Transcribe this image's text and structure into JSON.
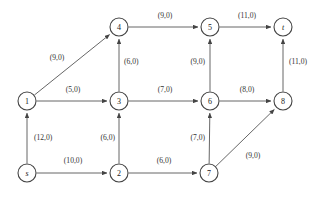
{
  "figure": {
    "type": "directed-network-flow-graph",
    "label_format": "(capacity,flow)",
    "background_color": "#ffffff",
    "edge_color": "#555555",
    "node_stroke_color": "#444444",
    "text_color": "#1a1a1a"
  },
  "nodes": [
    {
      "id": "s",
      "label": "s",
      "x": 27,
      "y": 173,
      "r": 9,
      "italic": true
    },
    {
      "id": "1",
      "label": "1",
      "x": 27,
      "y": 101,
      "r": 9,
      "italic": false
    },
    {
      "id": "2",
      "label": "2",
      "x": 119,
      "y": 173,
      "r": 9,
      "italic": false
    },
    {
      "id": "3",
      "label": "3",
      "x": 119,
      "y": 101,
      "r": 9,
      "italic": false
    },
    {
      "id": "4",
      "label": "4",
      "x": 119,
      "y": 27,
      "r": 9,
      "italic": false
    },
    {
      "id": "5",
      "label": "5",
      "x": 210,
      "y": 27,
      "r": 9,
      "italic": false
    },
    {
      "id": "6",
      "label": "6",
      "x": 210,
      "y": 101,
      "r": 9,
      "italic": false
    },
    {
      "id": "7",
      "label": "7",
      "x": 209,
      "y": 173,
      "r": 9,
      "italic": false
    },
    {
      "id": "8",
      "label": "8",
      "x": 283,
      "y": 101,
      "r": 9,
      "italic": false
    },
    {
      "id": "t",
      "label": "t",
      "x": 283,
      "y": 27,
      "r": 9,
      "italic": true
    }
  ],
  "edges": [
    {
      "from": "s",
      "to": "1",
      "capacity": 12,
      "flow": 0,
      "label": "(12,0)",
      "label_x": 34,
      "label_y": 137,
      "anchor": "start"
    },
    {
      "from": "s",
      "to": "2",
      "capacity": 10,
      "flow": 0,
      "label": "(10,0)",
      "label_x": 73,
      "label_y": 160,
      "anchor": "middle"
    },
    {
      "from": "1",
      "to": "4",
      "capacity": 9,
      "flow": 0,
      "label": "(9,0)",
      "label_x": 57,
      "label_y": 57,
      "anchor": "middle"
    },
    {
      "from": "1",
      "to": "3",
      "capacity": 5,
      "flow": 0,
      "label": "(5,0)",
      "label_x": 73,
      "label_y": 89,
      "anchor": "middle"
    },
    {
      "from": "2",
      "to": "3",
      "capacity": 6,
      "flow": 0,
      "label": "(6,0)",
      "label_x": 115,
      "label_y": 137,
      "anchor": "end"
    },
    {
      "from": "2",
      "to": "7",
      "capacity": 6,
      "flow": 0,
      "label": "(6,0)",
      "label_x": 164,
      "label_y": 160,
      "anchor": "middle"
    },
    {
      "from": "3",
      "to": "4",
      "capacity": 6,
      "flow": 0,
      "label": "(6,0)",
      "label_x": 124,
      "label_y": 61,
      "anchor": "start"
    },
    {
      "from": "3",
      "to": "6",
      "capacity": 7,
      "flow": 0,
      "label": "(7,0)",
      "label_x": 165,
      "label_y": 89,
      "anchor": "middle"
    },
    {
      "from": "4",
      "to": "5",
      "capacity": 9,
      "flow": 0,
      "label": "(9,0)",
      "label_x": 165,
      "label_y": 15,
      "anchor": "middle"
    },
    {
      "from": "5",
      "to": "t",
      "capacity": 11,
      "flow": 0,
      "label": "(11,0)",
      "label_x": 247,
      "label_y": 15,
      "anchor": "middle"
    },
    {
      "from": "6",
      "to": "5",
      "capacity": 9,
      "flow": 0,
      "label": "(9,0)",
      "label_x": 205,
      "label_y": 61,
      "anchor": "end"
    },
    {
      "from": "6",
      "to": "8",
      "capacity": 8,
      "flow": 0,
      "label": "(8,0)",
      "label_x": 247,
      "label_y": 89,
      "anchor": "middle"
    },
    {
      "from": "7",
      "to": "6",
      "capacity": 7,
      "flow": 0,
      "label": "(7,0)",
      "label_x": 205,
      "label_y": 137,
      "anchor": "end"
    },
    {
      "from": "7",
      "to": "8",
      "capacity": 9,
      "flow": 0,
      "label": "(9,0)",
      "label_x": 253,
      "label_y": 155,
      "anchor": "middle"
    },
    {
      "from": "8",
      "to": "t",
      "capacity": 11,
      "flow": 0,
      "label": "(11,0)",
      "label_x": 289,
      "label_y": 61,
      "anchor": "start"
    }
  ]
}
